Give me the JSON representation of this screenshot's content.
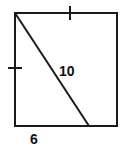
{
  "figure": {
    "background_color": "#ffffff",
    "stroke_color": "#1a1a1a",
    "label_color": "#111111",
    "stroke_width": 2,
    "square": {
      "name": "square-outline",
      "left": 15,
      "top": 13,
      "right": 117,
      "bottom": 126
    },
    "diagonal": {
      "name": "diagonal-segment",
      "x1": 15,
      "y1": 13,
      "x2": 89,
      "y2": 126,
      "label": "10",
      "label_x": 59,
      "label_y": 76
    },
    "base_segment": {
      "name": "base-segment",
      "label": "6",
      "label_x": 30,
      "label_y": 144
    },
    "tick_marks": [
      {
        "name": "tick-top-edge",
        "orientation": "vertical",
        "x1": 70,
        "y1": 6,
        "x2": 70,
        "y2": 20
      },
      {
        "name": "tick-left-edge",
        "orientation": "horizontal",
        "x1": 8,
        "y1": 68,
        "x2": 22,
        "y2": 68
      }
    ]
  },
  "chart_data": {
    "type": "diagram",
    "shape": "square",
    "annotations": [
      {
        "text": "10",
        "refers_to": "diagonal-segment"
      },
      {
        "text": "6",
        "refers_to": "base-segment"
      }
    ],
    "congruence_ticks": [
      "top-edge",
      "left-edge"
    ]
  }
}
